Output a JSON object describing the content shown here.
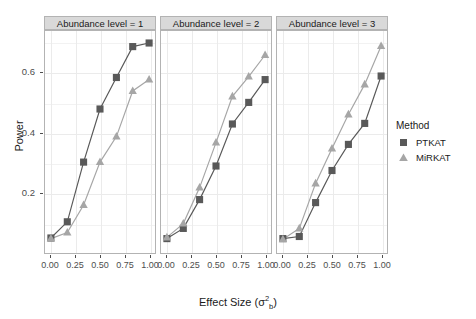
{
  "chart_data": {
    "type": "line",
    "title": "",
    "xlabel": "Effect Size (σ²b)",
    "ylabel": "Power",
    "xlim": [
      -0.06,
      1.06
    ],
    "ylim": [
      0.0,
      0.74
    ],
    "x": [
      0.0,
      0.167,
      0.333,
      0.5,
      0.667,
      0.833,
      1.0
    ],
    "xticks": [
      0.0,
      0.25,
      0.5,
      0.75,
      1.0
    ],
    "xticklabels": [
      "0.00",
      "0.25",
      "0.50",
      "0.75",
      "1.00"
    ],
    "yticks": [
      0.2,
      0.4,
      0.6
    ],
    "yticklabels": [
      "0.2",
      "0.4",
      "0.6"
    ],
    "grid": true,
    "legend_position": "right",
    "legend_title": "Method",
    "facet_variable": "Abundance level",
    "panels": [
      {
        "label": "Abundance level = 1",
        "series": [
          {
            "name": "PTKAT",
            "marker": "square",
            "color": "#595959",
            "values": [
              0.05,
              0.104,
              0.303,
              0.48,
              0.585,
              0.688,
              0.7
            ]
          },
          {
            "name": "MiRKAT",
            "marker": "triangle",
            "color": "#a6a6a6",
            "values": [
              0.048,
              0.068,
              0.16,
              0.303,
              0.388,
              0.54,
              0.578
            ]
          }
        ]
      },
      {
        "label": "Abundance level = 2",
        "series": [
          {
            "name": "PTKAT",
            "marker": "square",
            "color": "#595959",
            "values": [
              0.048,
              0.082,
              0.178,
              0.29,
              0.43,
              0.502,
              0.578
            ]
          },
          {
            "name": "MiRKAT",
            "marker": "triangle",
            "color": "#a6a6a6",
            "values": [
              0.052,
              0.098,
              0.218,
              0.368,
              0.522,
              0.588,
              0.66
            ]
          }
        ]
      },
      {
        "label": "Abundance level = 3",
        "series": [
          {
            "name": "PTKAT",
            "marker": "square",
            "color": "#595959",
            "values": [
              0.048,
              0.055,
              0.168,
              0.275,
              0.362,
              0.432,
              0.59
            ]
          },
          {
            "name": "MiRKAT",
            "marker": "triangle",
            "color": "#a6a6a6",
            "values": [
              0.046,
              0.082,
              0.232,
              0.348,
              0.462,
              0.562,
              0.69
            ]
          }
        ]
      }
    ]
  },
  "axes": {
    "y_title": "Power",
    "x_title_prefix": "Effect Size (",
    "x_title_symbol": "σ",
    "x_title_sup": "2",
    "x_title_sub": "b",
    "x_title_suffix": ")"
  },
  "legend": {
    "title": "Method",
    "items": [
      {
        "label": "PTKAT",
        "marker": "square",
        "color": "#595959"
      },
      {
        "label": "MiRKAT",
        "marker": "triangle",
        "color": "#a6a6a6"
      }
    ]
  },
  "theme": {
    "strip_background": "#d9d9d9",
    "panel_border": "#b3b3b3",
    "grid_color": "#f2f2f2",
    "text_color": "#4d4d4d",
    "background": "#ffffff"
  }
}
